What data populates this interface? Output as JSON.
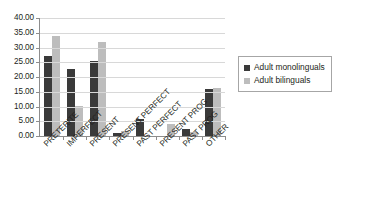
{
  "chart_data": {
    "type": "bar",
    "title": "",
    "subtitle": "",
    "xlabel": "",
    "ylabel": "",
    "ylim": [
      0,
      40
    ],
    "ytick_labels": [
      "40.00",
      "35.00",
      "30.00",
      "25.00",
      "20.00",
      "15.00",
      "10.00",
      "5.00",
      "0.00"
    ],
    "ytick_values": [
      40,
      35,
      30,
      25,
      20,
      15,
      10,
      5,
      0
    ],
    "grid": true,
    "legend_position": "right",
    "categories": [
      "PRETERITE",
      "IMPERFECT",
      "PRESENT",
      "PRESENT PERFECT",
      "PAST PERFECT",
      "PRESENT PROG",
      "PAST PROG",
      "OTHER"
    ],
    "series": [
      {
        "name": "Adult monolinguals",
        "color": "#3a3a3a",
        "values": [
          27.1,
          22.8,
          25.5,
          1.0,
          5.7,
          0.0,
          2.3,
          16.0
        ]
      },
      {
        "name": "Adult bilinguals",
        "color": "#bdbdbd",
        "values": [
          34.0,
          10.3,
          31.9,
          1.7,
          0.0,
          4.1,
          1.2,
          16.4
        ]
      }
    ]
  },
  "legend": {
    "entries": [
      {
        "label": "Adult monolinguals",
        "color": "#3a3a3a"
      },
      {
        "label": "Adult bilinguals",
        "color": "#bdbdbd"
      }
    ]
  },
  "axis": {
    "line_color": "#8d8d8d",
    "grid_color": "#d8d8d8"
  }
}
